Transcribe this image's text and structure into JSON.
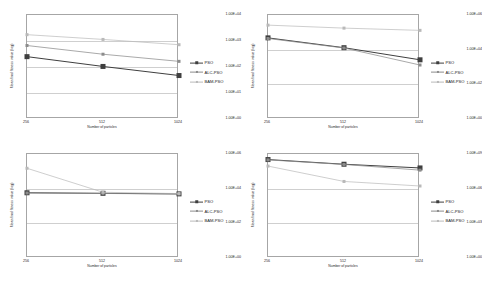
{
  "figure": {
    "axis_titles": {
      "x": "Number of particles",
      "y": "Mean final fitness value (log)"
    },
    "legend_labels": {
      "pso": "PSO",
      "alc": "ALC-PSO",
      "bam": "BAM-PSO"
    },
    "colors": {
      "pso": "#3f3f3f",
      "alc": "#8c8c8c",
      "bam": "#b9b9b9",
      "frame": "#a6a6a6",
      "grid": "#cfcfcf",
      "text": "#262626"
    }
  },
  "chart_data": [
    {
      "id": "panel-top-left",
      "type": "line",
      "title": "",
      "xlabel": "Number of particles",
      "ylabel": "Mean final fitness value (log)",
      "x": [
        256,
        512,
        1024
      ],
      "categories": [
        "256",
        "512",
        "1024"
      ],
      "yscale": "log",
      "ylim": [
        1,
        10000
      ],
      "yticks": [
        10000,
        1000,
        100,
        10,
        1
      ],
      "ytick_labels": [
        "1.00E+04",
        "1.00E+03",
        "1.00E+02",
        "1.00E+01",
        "1.00E+00"
      ],
      "grid": true,
      "legend_position": "right",
      "series": [
        {
          "name": "PSO",
          "values": [
            250,
            105,
            47
          ]
        },
        {
          "name": "ALC-PSO",
          "values": [
            670,
            310,
            165
          ]
        },
        {
          "name": "BAM-PSO",
          "values": [
            1750,
            1150,
            720
          ]
        }
      ]
    },
    {
      "id": "panel-top-right",
      "type": "line",
      "title": "",
      "xlabel": "Number of particles",
      "ylabel": "Mean final fitness value (log)",
      "x": [
        256,
        512,
        1024
      ],
      "categories": [
        "256",
        "512",
        "1024"
      ],
      "yscale": "log",
      "ylim": [
        1,
        1000000
      ],
      "yticks": [
        1000000,
        10000,
        100,
        1
      ],
      "ytick_labels": [
        "1.00E+06",
        "1.00E+04",
        "1.00E+02",
        "1.00E+00"
      ],
      "grid": true,
      "legend_position": "right",
      "series": [
        {
          "name": "PSO",
          "values": [
            48000,
            13000,
            2600
          ]
        },
        {
          "name": "ALC-PSO",
          "values": [
            44000,
            12500,
            1300
          ]
        },
        {
          "name": "BAM-PSO",
          "values": [
            260000,
            175000,
            130000
          ]
        }
      ]
    },
    {
      "id": "panel-bottom-left",
      "type": "line",
      "title": "",
      "xlabel": "Number of particles",
      "ylabel": "Mean final fitness value (log)",
      "x": [
        256,
        512,
        1024
      ],
      "categories": [
        "256",
        "512",
        "1024"
      ],
      "yscale": "log",
      "ylim": [
        1,
        1000000
      ],
      "yticks": [
        1000000,
        10000,
        100,
        1
      ],
      "ytick_labels": [
        "1.00E+06",
        "1.00E+04",
        "1.00E+02",
        "1.00E+00"
      ],
      "grid": true,
      "legend_position": "right",
      "series": [
        {
          "name": "PSO",
          "values": [
            5800,
            5400,
            5000
          ]
        },
        {
          "name": "ALC-PSO",
          "values": [
            5600,
            5300,
            4900
          ]
        },
        {
          "name": "BAM-PSO",
          "values": [
            150000,
            6200,
            5200
          ]
        }
      ]
    },
    {
      "id": "panel-bottom-right",
      "type": "line",
      "title": "",
      "xlabel": "Number of particles",
      "ylabel": "Mean final fitness value (log)",
      "x": [
        256,
        512,
        1024
      ],
      "categories": [
        "256",
        "512",
        "1024"
      ],
      "yscale": "log",
      "ylim": [
        1,
        1000000000
      ],
      "yticks": [
        1000000000,
        1000000,
        1000,
        1
      ],
      "ytick_labels": [
        "1.00E+09",
        "1.00E+06",
        "1.00E+03",
        "1.00E+00"
      ],
      "grid": true,
      "legend_position": "right",
      "series": [
        {
          "name": "PSO",
          "values": [
            330000000,
            130000000,
            62000000
          ]
        },
        {
          "name": "ALC-PSO",
          "values": [
            310000000,
            125000000,
            40000000
          ]
        },
        {
          "name": "BAM-PSO",
          "values": [
            90000000,
            4200000,
            1700000
          ]
        }
      ]
    }
  ]
}
